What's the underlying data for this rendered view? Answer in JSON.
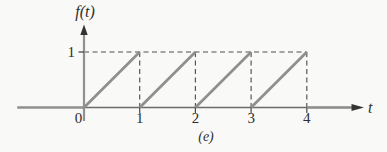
{
  "figure": {
    "ylabel": "f(t)",
    "xlabel": "t",
    "caption": "(e)",
    "y_tick_label": "1",
    "x_tick_labels": [
      "0",
      "1",
      "2",
      "3",
      "4"
    ]
  },
  "chart_data": {
    "type": "line",
    "xlabel": "t",
    "ylabel": "f(t)",
    "xlim": [
      -1.2,
      5.4
    ],
    "ylim": [
      0,
      1.45
    ],
    "x_ticks": [
      0,
      1,
      2,
      3,
      4
    ],
    "y_ticks": [
      1
    ],
    "grid": false,
    "legend": "none",
    "solid_segments": [
      [
        [
          -1.2,
          0
        ],
        [
          0,
          0
        ]
      ],
      [
        [
          0,
          0
        ],
        [
          1,
          1
        ]
      ],
      [
        [
          1,
          0
        ],
        [
          2,
          1
        ]
      ],
      [
        [
          2,
          0
        ],
        [
          3,
          1
        ]
      ],
      [
        [
          3,
          0
        ],
        [
          4,
          1
        ]
      ],
      [
        [
          4,
          0
        ],
        [
          4.8,
          0
        ]
      ]
    ],
    "dashed_segments": [
      [
        [
          0,
          1
        ],
        [
          4,
          1
        ]
      ],
      [
        [
          1,
          1
        ],
        [
          1,
          0
        ]
      ],
      [
        [
          2,
          1
        ],
        [
          2,
          0
        ]
      ],
      [
        [
          3,
          1
        ],
        [
          3,
          0
        ]
      ],
      [
        [
          4,
          1
        ],
        [
          4,
          0
        ]
      ]
    ]
  },
  "colors": {
    "background": "#f9f9f7",
    "curve": "#8f8f8f",
    "axis_gray": "#919191",
    "axis_line": "#6b6b6b",
    "dash": "#515151",
    "tick": "#474747",
    "arrow": "#333333",
    "text": "#2e2e2e"
  }
}
